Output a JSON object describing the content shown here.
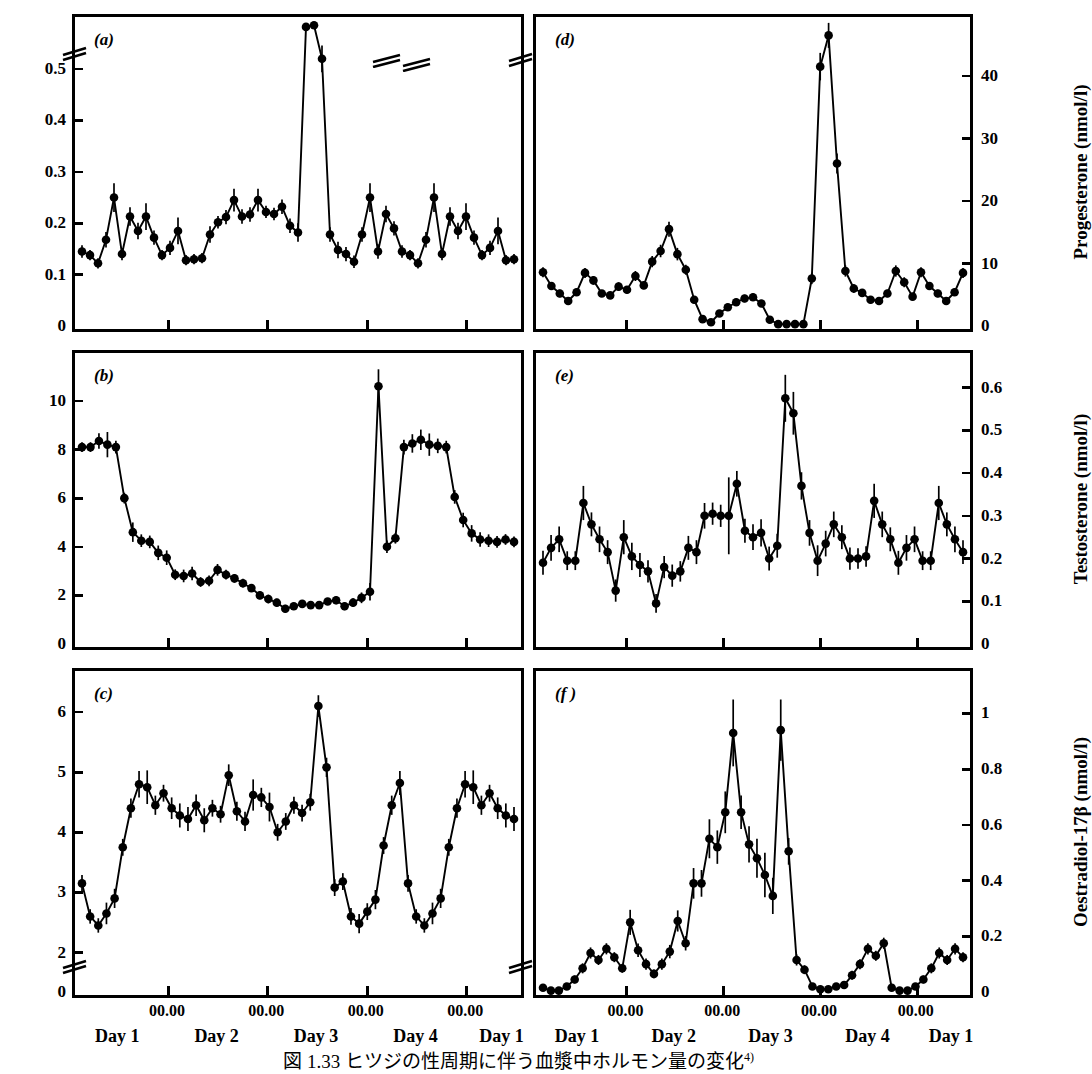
{
  "figure": {
    "caption": "図 1.33   ヒツジの性周期に伴う血漿中ホルモン量の変化",
    "caption_ref": "4)",
    "panel_count": 6,
    "ink_color": "#000000",
    "background_color": "#ffffff"
  },
  "xaxis": {
    "tick_labels": [
      "00.00",
      "00.00",
      "00.00",
      "00.00"
    ],
    "tick_positions_pct": [
      21.0,
      43.0,
      65.0,
      87.0
    ],
    "day_labels": [
      "Day 1",
      "Day 2",
      "Day 3",
      "Day 4",
      "Day 1"
    ],
    "day_positions_pct": [
      10.0,
      32.0,
      54.0,
      76.0,
      95.0
    ]
  },
  "chart_data": [
    {
      "id": "panel-a",
      "type": "line",
      "panel_letter": "(a)",
      "title": "",
      "ylabel": "LH (µg/l)",
      "yunit": "µg/l",
      "analyte": "LH",
      "axis_side": "left",
      "ylim": [
        0,
        0.58
      ],
      "yticks": [
        0,
        0.1,
        0.2,
        0.3,
        0.4,
        0.5
      ],
      "ytick_labels": [
        "0",
        "0.1",
        "0.2",
        "0.3",
        "0.4",
        "0.5"
      ],
      "axis_break": true,
      "axis_break_note": "break above 0.5 on y-axis; LH surge plotted above break",
      "grid": false,
      "legend": "none",
      "xlabel": "",
      "x": [
        0,
        1,
        2,
        3,
        4,
        5,
        6,
        7,
        8,
        9,
        10,
        11,
        12,
        13,
        14,
        15,
        16,
        17,
        18,
        19,
        20,
        21,
        22,
        23,
        24,
        25,
        26,
        27,
        28,
        29,
        30,
        31,
        32,
        33,
        34,
        35,
        36,
        37,
        38,
        39,
        40,
        41,
        42,
        43,
        44,
        45,
        46,
        47,
        48,
        49,
        50,
        51,
        52,
        53,
        54
      ],
      "values": [
        0.145,
        0.138,
        0.122,
        0.168,
        0.25,
        0.14,
        0.213,
        0.185,
        0.213,
        0.172,
        0.138,
        0.152,
        0.185,
        0.128,
        0.13,
        0.132,
        0.178,
        0.202,
        0.212,
        0.245,
        0.213,
        0.217,
        0.245,
        0.222,
        0.218,
        0.232,
        0.195,
        0.182,
        0.612,
        0.64,
        0.52,
        0.178,
        0.148,
        0.14,
        0.125,
        0.178,
        0.25,
        0.145,
        0.218,
        0.19,
        0.145,
        0.138,
        0.122,
        0.168,
        0.25,
        0.14,
        0.213,
        0.185,
        0.213,
        0.172,
        0.138,
        0.152,
        0.185,
        0.128,
        0.13
      ],
      "errors": [
        0.012,
        0.01,
        0.01,
        0.015,
        0.028,
        0.012,
        0.018,
        0.016,
        0.026,
        0.014,
        0.01,
        0.014,
        0.026,
        0.01,
        0.01,
        0.01,
        0.016,
        0.012,
        0.014,
        0.022,
        0.014,
        0.014,
        0.022,
        0.012,
        0.012,
        0.014,
        0.014,
        0.018,
        0.03,
        0.03,
        0.026,
        0.014,
        0.016,
        0.014,
        0.012,
        0.014,
        0.028,
        0.014,
        0.016,
        0.014,
        0.012,
        0.01,
        0.01,
        0.015,
        0.028,
        0.012,
        0.018,
        0.016,
        0.026,
        0.014,
        0.01,
        0.014,
        0.026,
        0.01,
        0.01
      ]
    },
    {
      "id": "panel-d",
      "type": "line",
      "panel_letter": "(d)",
      "title": "",
      "ylabel": "Progesterone (nmol/l)",
      "yunit": "nmol/l",
      "analyte": "Progesterone",
      "axis_side": "right",
      "ylim": [
        0,
        48
      ],
      "yticks": [
        0,
        10,
        20,
        30,
        40
      ],
      "ytick_labels": [
        "0",
        "10",
        "20",
        "30",
        "40"
      ],
      "axis_break": true,
      "axis_break_note": "break mark on shared left boundary",
      "grid": false,
      "legend": "none",
      "xlabel": "",
      "x": [
        0,
        1,
        2,
        3,
        4,
        5,
        6,
        7,
        8,
        9,
        10,
        11,
        12,
        13,
        14,
        15,
        16,
        17,
        18,
        19,
        20,
        21,
        22,
        23,
        24,
        25,
        26,
        27,
        28,
        29,
        30,
        31,
        32,
        33,
        34,
        35,
        36,
        37,
        38,
        39,
        40,
        41,
        42,
        43,
        44,
        45,
        46,
        47,
        48,
        49,
        50
      ],
      "values": [
        8.6,
        6.4,
        5.2,
        4.0,
        5.4,
        8.5,
        7.3,
        5.2,
        4.9,
        6.3,
        5.8,
        8.0,
        6.5,
        10.3,
        12.0,
        15.5,
        11.5,
        9.0,
        4.2,
        1.1,
        0.6,
        2.0,
        3.0,
        3.8,
        4.4,
        4.6,
        3.6,
        1.0,
        0.3,
        0.3,
        0.3,
        0.3,
        7.6,
        41.5,
        46.5,
        26.0,
        8.8,
        6.0,
        5.3,
        4.2,
        4.0,
        5.2,
        8.8,
        7.0,
        4.7,
        8.6,
        6.4,
        5.2,
        4.0,
        5.4,
        8.5
      ],
      "errors": [
        0.8,
        0.6,
        0.6,
        0.5,
        0.6,
        0.8,
        0.7,
        0.5,
        0.5,
        0.7,
        0.6,
        0.8,
        0.6,
        0.9,
        1.0,
        1.2,
        1.0,
        0.8,
        0.6,
        0.4,
        0.4,
        0.5,
        0.5,
        0.6,
        0.6,
        0.6,
        0.5,
        0.4,
        0.2,
        0.2,
        0.2,
        0.2,
        0.9,
        2.2,
        2.0,
        1.6,
        0.9,
        0.7,
        0.6,
        0.6,
        0.5,
        0.6,
        0.9,
        0.8,
        0.6,
        0.8,
        0.6,
        0.6,
        0.5,
        0.6,
        0.8
      ]
    },
    {
      "id": "panel-b",
      "type": "line",
      "panel_letter": "(b)",
      "title": "",
      "ylabel": "FSH (µg/l)",
      "yunit": "µg/l",
      "analyte": "FSH",
      "axis_side": "left",
      "ylim": [
        0,
        11.6
      ],
      "yticks": [
        0,
        2,
        4,
        6,
        8,
        10
      ],
      "ytick_labels": [
        "0",
        "2",
        "4",
        "6",
        "8",
        "10"
      ],
      "axis_break": false,
      "grid": false,
      "legend": "none",
      "xlabel": "",
      "x": [
        0,
        1,
        2,
        3,
        4,
        5,
        6,
        7,
        8,
        9,
        10,
        11,
        12,
        13,
        14,
        15,
        16,
        17,
        18,
        19,
        20,
        21,
        22,
        23,
        24,
        25,
        26,
        27,
        28,
        29,
        30,
        31,
        32,
        33,
        34,
        35,
        36,
        37,
        38,
        39,
        40,
        41,
        42,
        43,
        44,
        45,
        46,
        47,
        48,
        49,
        50,
        51
      ],
      "values": [
        8.1,
        8.1,
        8.35,
        8.2,
        8.1,
        6.0,
        4.6,
        4.25,
        4.2,
        3.75,
        3.55,
        2.85,
        2.8,
        2.9,
        2.55,
        2.6,
        3.05,
        2.85,
        2.7,
        2.5,
        2.3,
        2.0,
        1.85,
        1.7,
        1.45,
        1.55,
        1.65,
        1.6,
        1.6,
        1.75,
        1.8,
        1.55,
        1.7,
        1.9,
        2.15,
        10.6,
        4.0,
        4.35,
        8.1,
        8.25,
        8.4,
        8.2,
        8.15,
        8.1,
        6.05,
        5.1,
        4.55,
        4.3,
        4.25,
        4.2,
        4.3,
        4.2
      ],
      "errors": [
        0.2,
        0.2,
        0.32,
        0.52,
        0.26,
        0.22,
        0.4,
        0.26,
        0.26,
        0.3,
        0.3,
        0.22,
        0.26,
        0.28,
        0.2,
        0.22,
        0.24,
        0.2,
        0.18,
        0.18,
        0.16,
        0.16,
        0.18,
        0.16,
        0.16,
        0.14,
        0.14,
        0.14,
        0.14,
        0.14,
        0.16,
        0.16,
        0.18,
        0.22,
        0.36,
        0.7,
        0.26,
        0.22,
        0.3,
        0.38,
        0.42,
        0.46,
        0.3,
        0.26,
        0.28,
        0.3,
        0.34,
        0.3,
        0.26,
        0.24,
        0.22,
        0.22
      ]
    },
    {
      "id": "panel-e",
      "type": "line",
      "panel_letter": "(e)",
      "title": "",
      "ylabel": "Testosterone (nmol/l)",
      "yunit": "nmol/l",
      "analyte": "Testosterone",
      "axis_side": "right",
      "ylim": [
        0,
        0.66
      ],
      "yticks": [
        0,
        0.1,
        0.2,
        0.3,
        0.4,
        0.5,
        0.6
      ],
      "ytick_labels": [
        "0",
        "0.1",
        "0.2",
        "0.3",
        "0.4",
        "0.5",
        "0.6"
      ],
      "axis_break": false,
      "grid": false,
      "legend": "none",
      "xlabel": "",
      "x": [
        0,
        1,
        2,
        3,
        4,
        5,
        6,
        7,
        8,
        9,
        10,
        11,
        12,
        13,
        14,
        15,
        16,
        17,
        18,
        19,
        20,
        21,
        22,
        23,
        24,
        25,
        26,
        27,
        28,
        29,
        30,
        31,
        32,
        33,
        34,
        35,
        36,
        37,
        38,
        39,
        40,
        41,
        42,
        43,
        44,
        45,
        46,
        47,
        48,
        49,
        50,
        51,
        52
      ],
      "values": [
        0.19,
        0.225,
        0.245,
        0.195,
        0.195,
        0.33,
        0.28,
        0.245,
        0.215,
        0.125,
        0.25,
        0.205,
        0.185,
        0.17,
        0.095,
        0.18,
        0.16,
        0.17,
        0.225,
        0.215,
        0.3,
        0.305,
        0.3,
        0.3,
        0.375,
        0.265,
        0.25,
        0.26,
        0.2,
        0.23,
        0.575,
        0.54,
        0.37,
        0.26,
        0.195,
        0.235,
        0.28,
        0.25,
        0.2,
        0.2,
        0.205,
        0.335,
        0.28,
        0.245,
        0.19,
        0.225,
        0.245,
        0.195,
        0.195,
        0.33,
        0.28,
        0.245,
        0.215
      ],
      "errors": [
        0.028,
        0.03,
        0.03,
        0.022,
        0.022,
        0.04,
        0.028,
        0.03,
        0.028,
        0.026,
        0.04,
        0.032,
        0.028,
        0.026,
        0.022,
        0.026,
        0.026,
        0.024,
        0.028,
        0.028,
        0.03,
        0.026,
        0.026,
        0.09,
        0.03,
        0.028,
        0.03,
        0.032,
        0.028,
        0.028,
        0.055,
        0.05,
        0.032,
        0.03,
        0.036,
        0.03,
        0.03,
        0.028,
        0.026,
        0.024,
        0.024,
        0.04,
        0.03,
        0.028,
        0.028,
        0.03,
        0.03,
        0.022,
        0.022,
        0.04,
        0.028,
        0.03,
        0.028
      ]
    },
    {
      "id": "panel-c",
      "type": "line",
      "panel_letter": "(c)",
      "title": "",
      "ylabel": "Inhibin (µg/l)",
      "yunit": "µg/l",
      "analyte": "Inhibin",
      "axis_side": "left",
      "ylim": [
        0,
        6.6
      ],
      "yticks": [
        0,
        2,
        3,
        4,
        5,
        6
      ],
      "ytick_labels": [
        "0",
        "2",
        "3",
        "4",
        "5",
        "6"
      ],
      "axis_break": true,
      "axis_break_note": "break between 0 and 2 on y-axis",
      "grid": false,
      "legend": "none",
      "xlabel": "",
      "x": [
        0,
        1,
        2,
        3,
        4,
        5,
        6,
        7,
        8,
        9,
        10,
        11,
        12,
        13,
        14,
        15,
        16,
        17,
        18,
        19,
        20,
        21,
        22,
        23,
        24,
        25,
        26,
        27,
        28,
        29,
        30,
        31,
        32,
        33,
        34,
        35,
        36,
        37,
        38,
        39,
        40,
        41,
        42,
        43,
        44,
        45,
        46,
        47,
        48,
        49,
        50,
        51,
        52,
        53
      ],
      "values": [
        3.15,
        2.6,
        2.45,
        2.65,
        2.9,
        3.75,
        4.4,
        4.8,
        4.75,
        4.45,
        4.65,
        4.4,
        4.28,
        4.22,
        4.45,
        4.2,
        4.4,
        4.3,
        4.95,
        4.35,
        4.18,
        4.62,
        4.58,
        4.42,
        4.0,
        4.18,
        4.45,
        4.32,
        4.5,
        6.1,
        5.08,
        3.08,
        3.18,
        2.6,
        2.48,
        2.68,
        2.88,
        3.78,
        4.45,
        4.82,
        3.15,
        2.6,
        2.45,
        2.65,
        2.9,
        3.75,
        4.4,
        4.8,
        4.75,
        4.45,
        4.65,
        4.4,
        4.28,
        4.22
      ],
      "errors": [
        0.14,
        0.12,
        0.12,
        0.18,
        0.16,
        0.14,
        0.16,
        0.22,
        0.28,
        0.16,
        0.14,
        0.18,
        0.2,
        0.2,
        0.18,
        0.2,
        0.14,
        0.14,
        0.18,
        0.16,
        0.16,
        0.26,
        0.16,
        0.24,
        0.14,
        0.14,
        0.14,
        0.14,
        0.14,
        0.18,
        0.16,
        0.14,
        0.14,
        0.14,
        0.16,
        0.14,
        0.16,
        0.14,
        0.16,
        0.2,
        0.14,
        0.12,
        0.12,
        0.18,
        0.16,
        0.14,
        0.16,
        0.22,
        0.28,
        0.16,
        0.14,
        0.18,
        0.2,
        0.2
      ]
    },
    {
      "id": "panel-f",
      "type": "line",
      "panel_letter": "(f )",
      "title": "",
      "ylabel": "Oestradiol-17β (nmol/l)",
      "yunit": "nmol/l",
      "analyte": "Oestradiol-17β",
      "axis_side": "right",
      "ylim": [
        0,
        1.12
      ],
      "yticks": [
        0,
        0.2,
        0.4,
        0.6,
        0.8,
        1
      ],
      "ytick_labels": [
        "0",
        "0.2",
        "0.4",
        "0.6",
        "0.8",
        "1"
      ],
      "axis_break": true,
      "axis_break_note": "break mark on shared left boundary",
      "grid": false,
      "legend": "none",
      "xlabel": "",
      "x": [
        0,
        1,
        2,
        3,
        4,
        5,
        6,
        7,
        8,
        9,
        10,
        11,
        12,
        13,
        14,
        15,
        16,
        17,
        18,
        19,
        20,
        21,
        22,
        23,
        24,
        25,
        26,
        27,
        28,
        29,
        30,
        31,
        32,
        33,
        34,
        35,
        36,
        37,
        38,
        39,
        40,
        41,
        42,
        43,
        44,
        45,
        46,
        47,
        48,
        49,
        50,
        51,
        52,
        53
      ],
      "values": [
        0.015,
        0.005,
        0.005,
        0.02,
        0.045,
        0.085,
        0.14,
        0.115,
        0.155,
        0.125,
        0.085,
        0.25,
        0.15,
        0.1,
        0.065,
        0.1,
        0.145,
        0.255,
        0.175,
        0.39,
        0.39,
        0.55,
        0.52,
        0.645,
        0.93,
        0.645,
        0.53,
        0.48,
        0.42,
        0.345,
        0.94,
        0.505,
        0.115,
        0.08,
        0.02,
        0.01,
        0.01,
        0.02,
        0.025,
        0.06,
        0.1,
        0.155,
        0.13,
        0.175,
        0.015,
        0.005,
        0.005,
        0.02,
        0.045,
        0.085,
        0.14,
        0.115,
        0.155,
        0.125
      ],
      "errors": [
        0.01,
        0.005,
        0.005,
        0.012,
        0.014,
        0.018,
        0.02,
        0.018,
        0.02,
        0.018,
        0.016,
        0.045,
        0.024,
        0.02,
        0.016,
        0.02,
        0.024,
        0.038,
        0.026,
        0.055,
        0.048,
        0.07,
        0.06,
        0.075,
        0.12,
        0.06,
        0.065,
        0.07,
        0.08,
        0.065,
        0.11,
        0.048,
        0.02,
        0.016,
        0.01,
        0.008,
        0.008,
        0.01,
        0.012,
        0.016,
        0.018,
        0.02,
        0.018,
        0.02,
        0.01,
        0.005,
        0.005,
        0.012,
        0.014,
        0.018,
        0.02,
        0.018,
        0.02,
        0.018
      ]
    }
  ]
}
